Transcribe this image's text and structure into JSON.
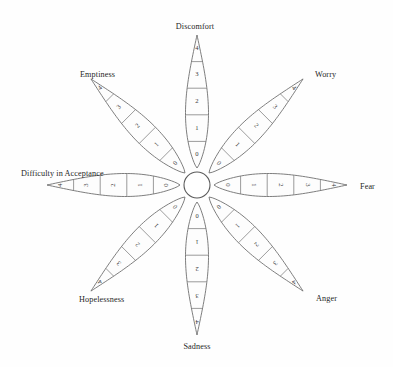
{
  "diagram": {
    "type": "radial-petal-rating-wheel",
    "background_color": "#fefefe",
    "line_color": "#6f6f6f",
    "text_color": "#262626",
    "center": {
      "x": 197,
      "y": 185,
      "radius": 13,
      "shape": "circle",
      "filled": false
    },
    "scale": {
      "min": 0,
      "max": 4,
      "steps": [
        "0",
        "1",
        "2",
        "3",
        "4"
      ],
      "direction": "center-to-tip"
    },
    "petals": [
      {
        "id": "discomfort",
        "label": "Discomfort",
        "angle_deg": 270,
        "position": "top",
        "label_x": 195,
        "label_y": 22,
        "segments": [
          "0",
          "1",
          "2",
          "3",
          "4"
        ],
        "outer_to_inner": [
          "4",
          "3",
          "2",
          "1",
          "0"
        ]
      },
      {
        "id": "worry",
        "label": "Worry",
        "angle_deg": 315,
        "position": "top-right",
        "label_x": 315,
        "label_y": 70,
        "segments": [
          "0",
          "1",
          "2",
          "3",
          "4"
        ],
        "outer_to_inner": [
          "4",
          "3",
          "2",
          "1",
          "0"
        ]
      },
      {
        "id": "fear",
        "label": "Fear",
        "angle_deg": 0,
        "position": "right",
        "label_x": 360,
        "label_y": 182,
        "segments": [
          "0",
          "1",
          "2",
          "3",
          "4"
        ],
        "outer_to_inner": [
          "4",
          "3",
          "2",
          "1",
          "0"
        ]
      },
      {
        "id": "anger",
        "label": "Anger",
        "angle_deg": 45,
        "position": "bottom-right",
        "label_x": 316,
        "label_y": 294,
        "segments": [
          "0",
          "1",
          "2",
          "3",
          "4"
        ],
        "outer_to_inner": [
          "4",
          "3",
          "2",
          "1",
          "0"
        ]
      },
      {
        "id": "sadness",
        "label": "Sadness",
        "angle_deg": 90,
        "position": "bottom",
        "label_x": 197,
        "label_y": 342,
        "segments": [
          "0",
          "1",
          "2",
          "3",
          "4"
        ],
        "outer_to_inner": [
          "4",
          "3",
          "2",
          "1",
          "0"
        ]
      },
      {
        "id": "hopelessness",
        "label": "Hopelessness",
        "angle_deg": 135,
        "position": "bottom-left",
        "label_x": 79,
        "label_y": 295,
        "segments": [
          "0",
          "1",
          "2",
          "3",
          "4"
        ],
        "outer_to_inner": [
          "4",
          "3",
          "2",
          "1",
          "0"
        ]
      },
      {
        "id": "difficulty-in-acceptance",
        "label": "Difficulty in Acceptance",
        "angle_deg": 180,
        "position": "left",
        "label_x": 21,
        "label_y": 169,
        "segments": [
          "0",
          "1",
          "2",
          "3",
          "4"
        ],
        "outer_to_inner": [
          "4",
          "3",
          "2",
          "1",
          "0"
        ]
      },
      {
        "id": "emptiness",
        "label": "Emptiness",
        "angle_deg": 225,
        "position": "top-left",
        "label_x": 80,
        "label_y": 70,
        "segments": [
          "0",
          "1",
          "2",
          "3",
          "4"
        ],
        "outer_to_inner": [
          "4",
          "3",
          "2",
          "1",
          "0"
        ]
      }
    ]
  }
}
